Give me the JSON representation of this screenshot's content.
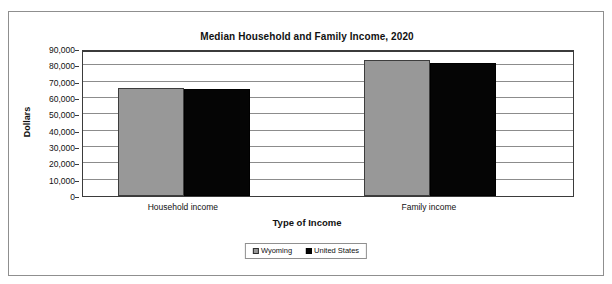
{
  "chart_data": {
    "type": "bar",
    "title": "Median Household and Family Income, 2020",
    "xlabel": "Type of Income",
    "ylabel": "Dollars",
    "categories": [
      "Household income",
      "Family income"
    ],
    "series": [
      {
        "name": "Wyoming",
        "color": "#989898",
        "values": [
          65900,
          83200
        ]
      },
      {
        "name": "United States",
        "color": "#050505",
        "values": [
          65700,
          81600
        ]
      }
    ],
    "ylim": [
      0,
      90000
    ],
    "ytick_values": [
      90000,
      80000,
      70000,
      60000,
      50000,
      40000,
      30000,
      20000,
      10000,
      0
    ],
    "ytick_labels": [
      "90,000",
      "80,000",
      "70,000",
      "60,000",
      "50,000",
      "40,000",
      "30,000",
      "20,000",
      "10,000",
      "0"
    ],
    "grid": true,
    "grid_axis": "y",
    "legend_position": "bottom-center",
    "legend_entries": [
      "Wyoming",
      "United States"
    ],
    "bar_mode": "grouped",
    "group_gap": true
  },
  "figure": {
    "background_color": "#ffffff",
    "frame_color": "#8f8f8f",
    "axis_color": "#3b3b3b",
    "gridline_color": "#8c8c8c"
  }
}
